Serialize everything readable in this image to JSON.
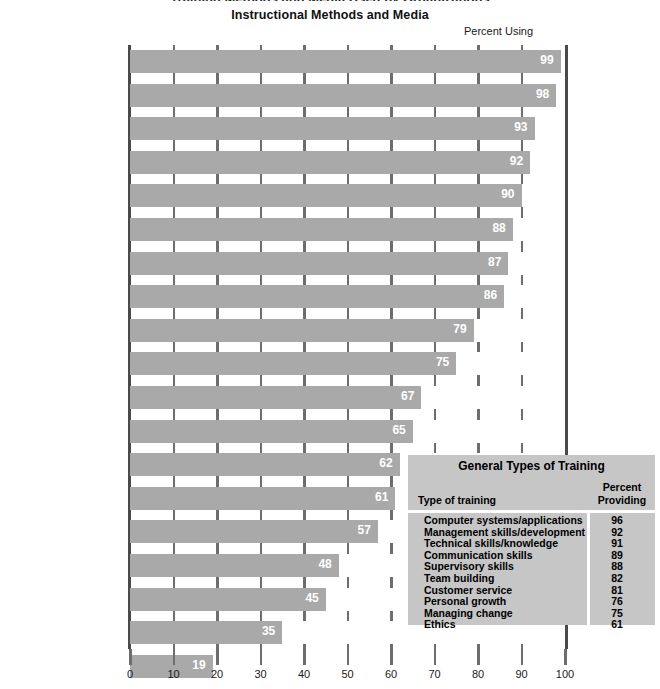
{
  "top_clipped_text": "Training Methods and Media Used by Organizations",
  "chart_data": {
    "type": "bar",
    "orientation": "horizontal",
    "title": "Instructional Methods and Media",
    "value_axis_caption": "Percent Using",
    "xlabel": "",
    "ylabel": "",
    "xlim": [
      0,
      100
    ],
    "xticks": [
      0,
      10,
      20,
      30,
      40,
      50,
      60,
      70,
      80,
      90,
      100
    ],
    "grid": true,
    "legend": "none",
    "bar_color": "#a9a9a9",
    "value_label_color": "#ffffff",
    "categories": [
      "Classroom\nwith instructor",
      "Workbooks/manuals",
      "Internet/Intranet/Extranet",
      "CD-ROM/DVD",
      "Public seminars",
      "Videotapes",
      "Self-Study, Web-based",
      "Case studies",
      "Role plays",
      "Non-computerized\nself-study",
      "Teleconferencing (audio)",
      "Games/simulations\n(non computer-based)",
      "Videoconferencing",
      "Virtual classroom\n(with instructor)",
      "Computer-based\ngames/simulations",
      "Audiocassettes",
      "Satellite/broadcast TV",
      "Experiential programs",
      "Virtual reality\nprograms"
    ],
    "values": [
      99,
      98,
      93,
      92,
      90,
      88,
      87,
      86,
      79,
      75,
      67,
      65,
      62,
      61,
      57,
      48,
      45,
      35,
      19
    ]
  },
  "types_table": {
    "title": "General Types of Training",
    "col_header_name": "Type of training",
    "col_header_percent": "Percent\nProviding",
    "rows": [
      {
        "name": "Computer systems/applications",
        "percent": "96"
      },
      {
        "name": "Management skills/development",
        "percent": "92"
      },
      {
        "name": "Technical skills/knowledge",
        "percent": "91"
      },
      {
        "name": "Communication skills",
        "percent": "89"
      },
      {
        "name": "Supervisory skills",
        "percent": "88"
      },
      {
        "name": "Team building",
        "percent": "82"
      },
      {
        "name": "Customer service",
        "percent": "81"
      },
      {
        "name": "Personal growth",
        "percent": "76"
      },
      {
        "name": "Managing change",
        "percent": "75"
      },
      {
        "name": "Ethics",
        "percent": "61"
      }
    ]
  }
}
